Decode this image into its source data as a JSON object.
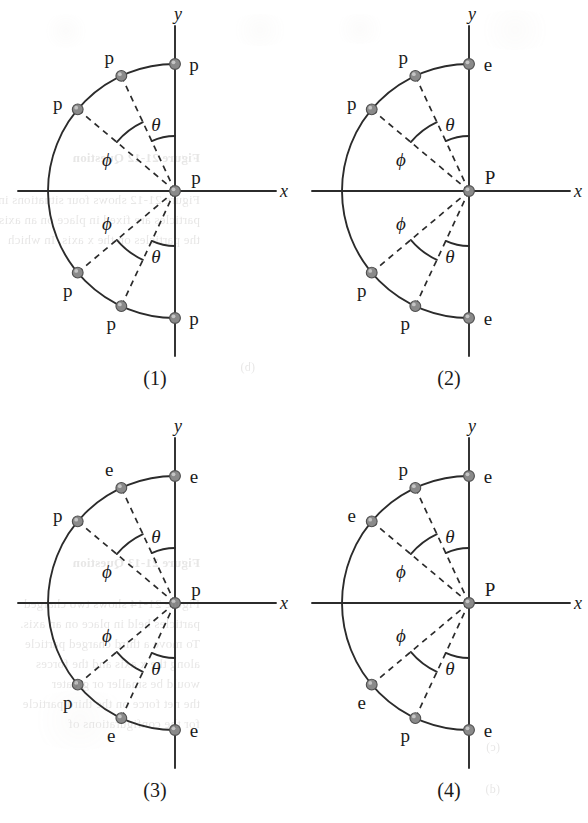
{
  "figure": {
    "kind": "four-panel-physics-diagram",
    "colors": {
      "background": "#ffffff",
      "line": "#2b2b2b",
      "dashed": "#2b2b2b",
      "node_fill": "#8a8a8a",
      "node_stroke": "#4f4f4f",
      "text": "#1a1a1a"
    },
    "axis_labels": {
      "x": "x",
      "y": "y"
    },
    "angle_labels": {
      "theta": "θ",
      "phi": "ϕ"
    },
    "geometry": {
      "center_x": 175,
      "center_y": 191,
      "radius": 127,
      "theta_deg": 25,
      "phi_deg": 50,
      "arc_theta_radius": 55,
      "arc_phi_radius": 76
    }
  },
  "panels": [
    {
      "id": "panel-1",
      "caption": "(1)",
      "center_label": "p",
      "nodes": [
        {
          "name": "node-y-top",
          "label": "p",
          "angle_deg": 90,
          "label_side": "right"
        },
        {
          "name": "node-theta-top",
          "label": "p",
          "angle_deg": 115,
          "label_side": "above"
        },
        {
          "name": "node-phi-top",
          "label": "p",
          "angle_deg": 140,
          "label_side": "left"
        },
        {
          "name": "node-phi-bottom",
          "label": "p",
          "angle_deg": -140,
          "label_side": "below"
        },
        {
          "name": "node-theta-bottom",
          "label": "p",
          "angle_deg": -115,
          "label_side": "below"
        },
        {
          "name": "node-y-bottom",
          "label": "p",
          "angle_deg": -90,
          "label_side": "right"
        }
      ]
    },
    {
      "id": "panel-2",
      "caption": "(2)",
      "center_label": "P",
      "nodes": [
        {
          "name": "node-y-top",
          "label": "e",
          "angle_deg": 90,
          "label_side": "right"
        },
        {
          "name": "node-theta-top",
          "label": "p",
          "angle_deg": 115,
          "label_side": "above"
        },
        {
          "name": "node-phi-top",
          "label": "p",
          "angle_deg": 140,
          "label_side": "left"
        },
        {
          "name": "node-phi-bottom",
          "label": "p",
          "angle_deg": -140,
          "label_side": "below"
        },
        {
          "name": "node-theta-bottom",
          "label": "p",
          "angle_deg": -115,
          "label_side": "below"
        },
        {
          "name": "node-y-bottom",
          "label": "e",
          "angle_deg": -90,
          "label_side": "right"
        }
      ]
    },
    {
      "id": "panel-3",
      "caption": "(3)",
      "center_label": "p",
      "nodes": [
        {
          "name": "node-y-top",
          "label": "e",
          "angle_deg": 90,
          "label_side": "right"
        },
        {
          "name": "node-theta-top",
          "label": "e",
          "angle_deg": 115,
          "label_side": "above"
        },
        {
          "name": "node-phi-top",
          "label": "p",
          "angle_deg": 140,
          "label_side": "left"
        },
        {
          "name": "node-phi-bottom",
          "label": "p",
          "angle_deg": -140,
          "label_side": "below"
        },
        {
          "name": "node-theta-bottom",
          "label": "e",
          "angle_deg": -115,
          "label_side": "below"
        },
        {
          "name": "node-y-bottom",
          "label": "e",
          "angle_deg": -90,
          "label_side": "right"
        }
      ]
    },
    {
      "id": "panel-4",
      "caption": "(4)",
      "center_label": "P",
      "nodes": [
        {
          "name": "node-y-top",
          "label": "e",
          "angle_deg": 90,
          "label_side": "right"
        },
        {
          "name": "node-theta-top",
          "label": "p",
          "angle_deg": 115,
          "label_side": "above"
        },
        {
          "name": "node-phi-top",
          "label": "e",
          "angle_deg": 140,
          "label_side": "left"
        },
        {
          "name": "node-phi-bottom",
          "label": "e",
          "angle_deg": -140,
          "label_side": "below"
        },
        {
          "name": "node-theta-bottom",
          "label": "p",
          "angle_deg": -115,
          "label_side": "below"
        },
        {
          "name": "node-y-bottom",
          "label": "e",
          "angle_deg": -90,
          "label_side": "right"
        }
      ]
    }
  ],
  "bleedthrough": [
    {
      "text": "Figure 21-12  Question",
      "x": 200,
      "y": 150,
      "bold": true,
      "size": 13
    },
    {
      "text": "Figure 21-12 shows four situations in which charged",
      "x": 200,
      "y": 192,
      "bold": false,
      "size": 13
    },
    {
      "text": "particles are fixed in place on an axis. In which sit",
      "x": 200,
      "y": 212,
      "bold": false,
      "size": 13
    },
    {
      "text": "the particles on the x axis. In which",
      "x": 200,
      "y": 232,
      "bold": false,
      "size": 13
    },
    {
      "text": "Figure 21-13  Question",
      "x": 200,
      "y": 555,
      "bold": true,
      "size": 13
    },
    {
      "text": "Figure 21-14 shows two charged",
      "x": 200,
      "y": 596,
      "bold": false,
      "size": 13
    },
    {
      "text": "particles held in place on an axis.",
      "x": 200,
      "y": 616,
      "bold": false,
      "size": 13
    },
    {
      "text": "To move a third charged particle",
      "x": 200,
      "y": 636,
      "bold": false,
      "size": 13
    },
    {
      "text": "along the x axis and the forces",
      "x": 200,
      "y": 656,
      "bold": false,
      "size": 13
    },
    {
      "text": "would be smaller or greater",
      "x": 200,
      "y": 676,
      "bold": false,
      "size": 13
    },
    {
      "text": "the net force on the third particle",
      "x": 200,
      "y": 696,
      "bold": false,
      "size": 13
    },
    {
      "text": "for the configurations of",
      "x": 200,
      "y": 716,
      "bold": false,
      "size": 13
    },
    {
      "text": "(b)",
      "x": 255,
      "y": 360,
      "bold": false,
      "size": 12
    },
    {
      "text": "(c)",
      "x": 500,
      "y": 740,
      "bold": false,
      "size": 12
    },
    {
      "text": "(d)",
      "x": 500,
      "y": 782,
      "bold": false,
      "size": 12
    }
  ]
}
